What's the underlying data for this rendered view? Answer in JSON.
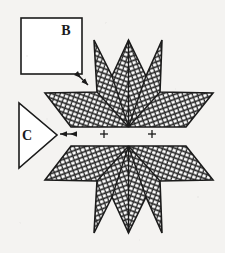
{
  "figure": {
    "background_color": "#f4f3f1",
    "ink_color": "#1b1b1b",
    "hatch_fill_color": "#2a2a2a"
  },
  "callouts": {
    "square": {
      "label": "B",
      "x": 21,
      "y": 18,
      "width": 61,
      "height": 56,
      "stroke_width": 1.6
    },
    "triangle": {
      "label": "C",
      "points": "19,103 19,168 57,135",
      "stroke_width": 1.6
    }
  },
  "arrows": {
    "diagonal": {
      "name": "diagonal-double-arrow",
      "x1": 88,
      "y1": 85,
      "x2": 76,
      "y2": 73
    },
    "horizontal": {
      "name": "horizontal-double-arrow",
      "x1": 60,
      "y1": 134,
      "x2": 77,
      "y2": 134
    }
  },
  "fiducials": [
    {
      "name": "plus-mark-left",
      "cx": 104,
      "cy": 134,
      "size": 4
    },
    {
      "name": "plus-mark-right",
      "cx": 152,
      "cy": 134,
      "size": 4
    }
  ],
  "star": {
    "name": "hatched-star",
    "center_x": 128.5,
    "upper_half_points": "94,40 112,76 128.5,40 146,76 162,40 160,92 213,93 186,127 128.5,127 71,127 45,93 97,92",
    "lower_half_points": "94,233 112,197 128.5,233 146,197 162,233 160,181 213,180 186,146 128.5,146 71,146 45,180 97,181",
    "hatch_spacing": 4.6,
    "hatch_stroke_width": 1.25,
    "outline_stroke_width": 1.6
  }
}
